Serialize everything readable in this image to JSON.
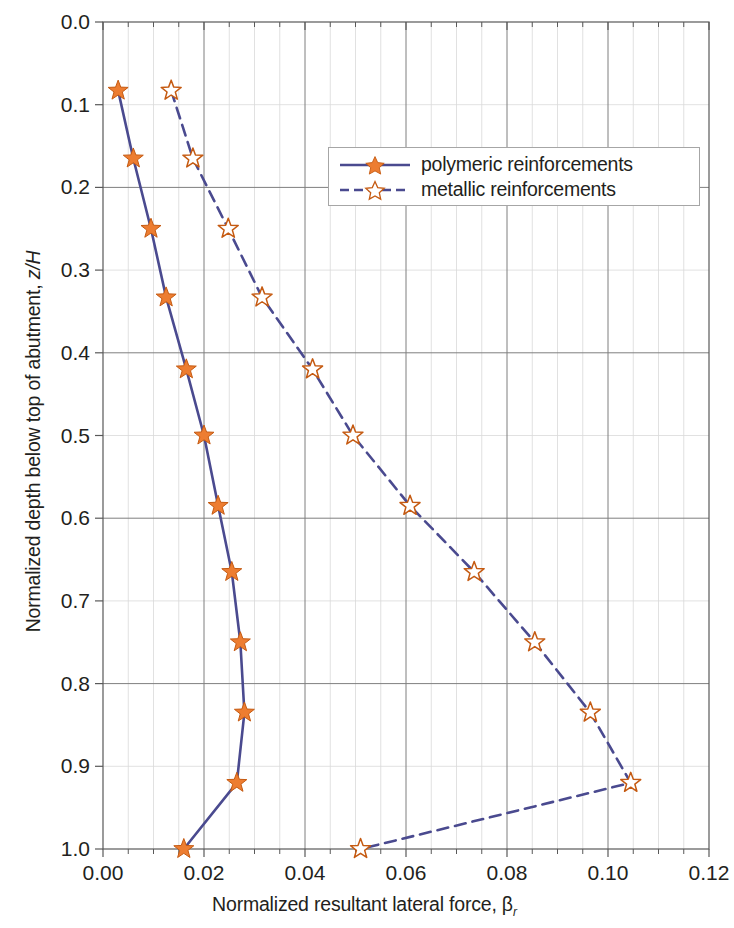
{
  "chart_data": {
    "type": "line",
    "title": "",
    "xlabel": "Normalized resultant lateral force, β",
    "xlabel_subscript": "r",
    "ylabel": "Normalized depth below top of abutment, z/H",
    "ylabel_plain": "Normalized depth below top of abutment, ",
    "ylabel_italic": "z/H",
    "xlim": [
      0.0,
      0.12
    ],
    "ylim": [
      0.0,
      1.0
    ],
    "y_inverted": true,
    "xticks": [
      "0.00",
      "0.02",
      "0.04",
      "0.06",
      "0.08",
      "0.10",
      "0.12"
    ],
    "xtick_values": [
      0.0,
      0.02,
      0.04,
      0.06,
      0.08,
      0.1,
      0.12
    ],
    "x_minor_step": 0.005,
    "yticks": [
      "0.0",
      "0.1",
      "0.2",
      "0.3",
      "0.4",
      "0.5",
      "0.6",
      "0.7",
      "0.8",
      "0.9",
      "1.0"
    ],
    "ytick_values": [
      0.0,
      0.1,
      0.2,
      0.3,
      0.4,
      0.5,
      0.6,
      0.7,
      0.8,
      0.9,
      1.0
    ],
    "grid": true,
    "legend_position": "upper center",
    "colors": {
      "line": "#4a4a8f",
      "marker_fill": "#ed7d31",
      "marker_edge": "#c55a11",
      "grid_major": "#7f7f7f",
      "grid_minor": "#d9d9d9",
      "axis": "#595959",
      "text": "#231f20",
      "legend_border": "#a6a6a6"
    },
    "series": [
      {
        "name": "polymeric reinforcements",
        "marker": "star-filled",
        "linestyle": "solid",
        "x": [
          0.003,
          0.006,
          0.0095,
          0.0125,
          0.0165,
          0.02,
          0.0228,
          0.0255,
          0.0272,
          0.028,
          0.0265,
          0.016
        ],
        "y": [
          0.083,
          0.165,
          0.25,
          0.333,
          0.42,
          0.5,
          0.585,
          0.665,
          0.75,
          0.835,
          0.92,
          1.0
        ]
      },
      {
        "name": "metallic reinforcements",
        "marker": "star-open",
        "linestyle": "dashed",
        "x": [
          0.0135,
          0.0178,
          0.0248,
          0.0315,
          0.0415,
          0.0495,
          0.0608,
          0.0735,
          0.0855,
          0.0965,
          0.1045,
          0.051
        ],
        "y": [
          0.083,
          0.165,
          0.25,
          0.333,
          0.42,
          0.5,
          0.585,
          0.665,
          0.75,
          0.835,
          0.92,
          1.0
        ]
      }
    ]
  },
  "legend": {
    "items": [
      {
        "label": "polymeric reinforcements"
      },
      {
        "label": "metallic reinforcements"
      }
    ]
  }
}
